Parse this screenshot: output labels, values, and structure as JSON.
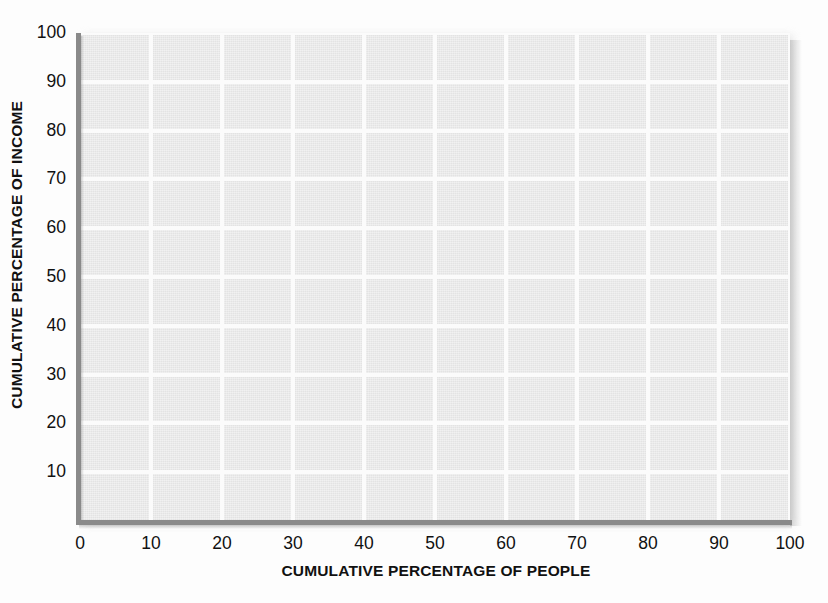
{
  "chart_data": {
    "type": "line",
    "title": "",
    "subtitle": "",
    "xlabel": "CUMULATIVE PERCENTAGE OF PEOPLE",
    "ylabel": "CUMULATIVE PERCENTAGE OF INCOME",
    "xlim": [
      0,
      100
    ],
    "ylim": [
      0,
      100
    ],
    "xticks": [
      "0",
      "10",
      "20",
      "30",
      "40",
      "50",
      "60",
      "70",
      "80",
      "90",
      "100"
    ],
    "xtick_values": [
      0,
      10,
      20,
      30,
      40,
      50,
      60,
      70,
      80,
      90,
      100
    ],
    "yticks": [
      "10",
      "20",
      "30",
      "40",
      "50",
      "60",
      "70",
      "80",
      "90",
      "100"
    ],
    "ytick_values": [
      10,
      20,
      30,
      40,
      50,
      60,
      70,
      80,
      90,
      100
    ],
    "grid": true,
    "grid_color": "#fbfbfb",
    "plot_background": "#e9e9e9",
    "axis_color": "#8a8a8a",
    "legend": [],
    "annotations": [],
    "series": [],
    "note": "Blank Lorenz-curve grid template; no data series are plotted."
  },
  "axes": {
    "y_title": "CUMULATIVE PERCENTAGE OF INCOME",
    "x_title": "CUMULATIVE PERCENTAGE OF PEOPLE"
  },
  "ticks": {
    "y": [
      {
        "label": "100",
        "value": 100
      },
      {
        "label": "90",
        "value": 90
      },
      {
        "label": "80",
        "value": 80
      },
      {
        "label": "70",
        "value": 70
      },
      {
        "label": "60",
        "value": 60
      },
      {
        "label": "50",
        "value": 50
      },
      {
        "label": "40",
        "value": 40
      },
      {
        "label": "30",
        "value": 30
      },
      {
        "label": "20",
        "value": 20
      },
      {
        "label": "10",
        "value": 10
      }
    ],
    "x": [
      {
        "label": "0",
        "value": 0
      },
      {
        "label": "10",
        "value": 10
      },
      {
        "label": "20",
        "value": 20
      },
      {
        "label": "30",
        "value": 30
      },
      {
        "label": "40",
        "value": 40
      },
      {
        "label": "50",
        "value": 50
      },
      {
        "label": "60",
        "value": 60
      },
      {
        "label": "70",
        "value": 70
      },
      {
        "label": "80",
        "value": 80
      },
      {
        "label": "90",
        "value": 90
      },
      {
        "label": "100",
        "value": 100
      }
    ]
  },
  "colors": {
    "page_background": "#fdfdfd",
    "plot_fill": "#e9e9e9",
    "gridline": "#fbfbfb",
    "axis": "#8a8a8a",
    "text": "#111111"
  }
}
